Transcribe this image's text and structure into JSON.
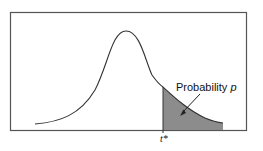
{
  "figure": {
    "type": "probability-density-diagram",
    "annotation_label": "Probability",
    "annotation_variable": "p",
    "tick_label": "t*",
    "colors": {
      "frame": "#555555",
      "curve": "#333333",
      "shaded_region": "#8c8c8c",
      "background": "#ffffff"
    }
  }
}
